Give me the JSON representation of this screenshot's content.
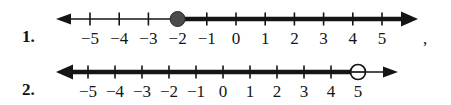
{
  "page": {
    "background_color": "#ffffff",
    "ink_color": "#151515"
  },
  "problems": [
    {
      "number_label": "1.",
      "tick_values": [
        -5,
        -4,
        -3,
        -2,
        -1,
        0,
        1,
        2,
        3,
        4,
        5
      ],
      "tick_labels": [
        "−5",
        "−4",
        "−3",
        "−2",
        "−1",
        "0",
        "1",
        "2",
        "3",
        "4",
        "5"
      ],
      "endpoint": {
        "value": -2,
        "marker": "closed-dot",
        "filled": true
      },
      "shaded_direction": "right",
      "left_arrow": true,
      "right_arrow": true,
      "trailing_punctuation": ",",
      "geometry": {
        "tick_start_x": 90,
        "tick_spacing": 29.2,
        "axis_y": 19,
        "line_left_x": 62,
        "line_right_x": 412,
        "thin_line_width": 1.6,
        "thick_line_width": 4.4,
        "tick_height": 13,
        "dot_radius": 7.5
      }
    },
    {
      "number_label": "2.",
      "tick_values": [
        -5,
        -4,
        -3,
        -2,
        -1,
        0,
        1,
        2,
        3,
        4,
        5
      ],
      "tick_labels": [
        "−5",
        "−4",
        "−3",
        "−2",
        "−1",
        "0",
        "1",
        "2",
        "3",
        "4",
        "5"
      ],
      "endpoint": {
        "value": 5,
        "marker": "open-circle",
        "filled": false
      },
      "shaded_direction": "left",
      "left_arrow": true,
      "right_arrow": true,
      "trailing_punctuation": "",
      "geometry": {
        "tick_start_x": 88,
        "tick_spacing": 27.0,
        "axis_y": 19,
        "line_left_x": 62,
        "line_right_x": 392,
        "thin_line_width": 1.6,
        "thick_line_width": 4.4,
        "tick_height": 13,
        "dot_radius": 7.5
      }
    }
  ]
}
